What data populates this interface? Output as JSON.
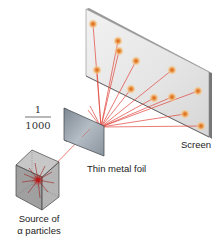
{
  "diagram": {
    "type": "rutherford-gold-foil-experiment",
    "labels": {
      "fraction_numerator": "1",
      "fraction_denominator": "1000",
      "screen": "Screen",
      "foil": "Thin metal foil",
      "source_line1": "Source of",
      "source_line2": "α particles"
    },
    "colors": {
      "ray": "#e0443a",
      "spot_core": "#e07a20",
      "spot_halo": "#f3c48a",
      "screen_face": "#e8e8e8",
      "screen_edge": "#888888",
      "foil": "#9aa4ad",
      "cube": "#a9a9a9"
    },
    "ray_origin": [
      101,
      127
    ],
    "spots": [
      [
        93,
        24
      ],
      [
        118,
        41
      ],
      [
        119,
        51
      ],
      [
        136,
        61
      ],
      [
        97,
        70
      ],
      [
        172,
        70
      ],
      [
        131,
        89
      ],
      [
        154,
        98
      ],
      [
        172,
        97
      ],
      [
        198,
        91
      ],
      [
        185,
        114
      ],
      [
        201,
        126
      ]
    ]
  }
}
